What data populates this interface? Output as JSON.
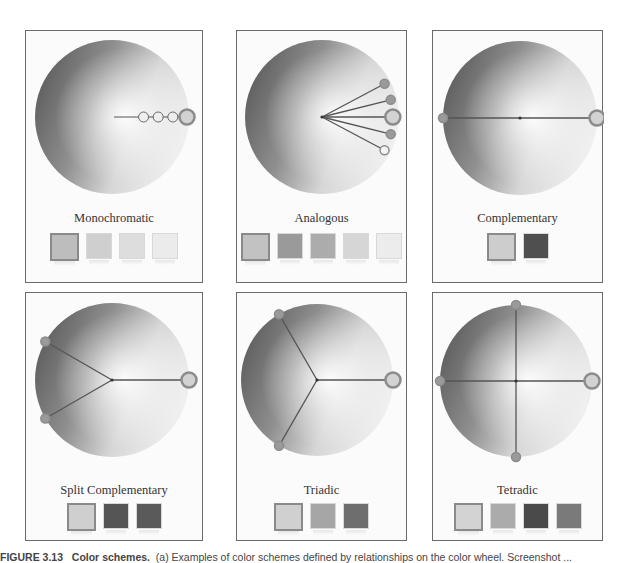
{
  "figure": {
    "caption_label": "FIGURE 3.13",
    "caption_title": "Color schemes.",
    "caption_text": "(a) Examples of color schemes defined by relationships on the color wheel. Screenshot ..."
  },
  "colors": {
    "panel_border": "#6a6a6a",
    "panel_bg": "#fbfbfb",
    "line": "#555555",
    "marker_ring": "#8c8c8c"
  },
  "panels": [
    {
      "id": "monochromatic",
      "title": "Monochromatic",
      "swatches": [
        "#bdbdbd",
        "#cfcfcf",
        "#dddddd",
        "#ebebeb"
      ],
      "marker_angles_deg": [
        0
      ],
      "inner_markers": 3
    },
    {
      "id": "analogous",
      "title": "Analogous",
      "swatches": [
        "#c2c2c2",
        "#9a9a9a",
        "#acacac",
        "#d6d6d6",
        "#ececec"
      ],
      "marker_angles_deg": [
        -28,
        -14,
        0,
        14,
        28
      ]
    },
    {
      "id": "complementary",
      "title": "Complementary",
      "swatches": [
        "#cdcdcd",
        "#4f4f4f"
      ],
      "marker_angles_deg": [
        0,
        180
      ]
    },
    {
      "id": "split-complementary",
      "title": "Split Complementary",
      "swatches": [
        "#cfcfcf",
        "#555555",
        "#5a5a5a"
      ],
      "marker_angles_deg": [
        0,
        150,
        210
      ]
    },
    {
      "id": "triadic",
      "title": "Triadic",
      "swatches": [
        "#d0d0d0",
        "#a6a6a6",
        "#6e6e6e"
      ],
      "marker_angles_deg": [
        0,
        120,
        240
      ]
    },
    {
      "id": "tetradic",
      "title": "Tetradic",
      "swatches": [
        "#d3d3d3",
        "#ababab",
        "#4a4a4a",
        "#7a7a7a"
      ],
      "marker_angles_deg": [
        0,
        90,
        180,
        270
      ]
    }
  ]
}
